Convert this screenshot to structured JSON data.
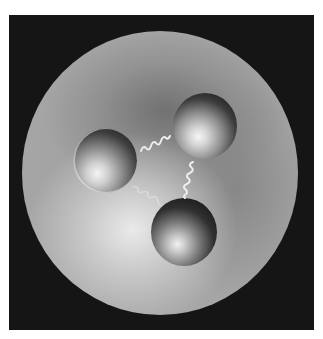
{
  "image": {
    "subject": "Illustration of a baryon (proton) containing three quarks bound by gluons",
    "colors": {
      "page_background": "#ffffff",
      "frame_background": "#151515",
      "hadron_rim": "#a9a9a9",
      "hadron_dark_zone": "#7a7a7a",
      "hadron_bright_zone": "#e0e0e0",
      "gluon_stroke": "#eeeeee"
    },
    "hadron": {
      "shape": "sphere",
      "center": [
        159,
        173
      ],
      "radius": 140
    },
    "quarks": [
      {
        "id": "q1",
        "position": "left",
        "center": [
          105,
          160
        ],
        "radius": 32
      },
      {
        "id": "q2",
        "position": "top-right",
        "center": [
          205,
          126
        ],
        "radius": 33
      },
      {
        "id": "q3",
        "position": "bottom",
        "center": [
          184,
          232
        ],
        "radius": 33
      }
    ],
    "gluons": [
      {
        "connects": [
          "q1",
          "q2"
        ],
        "from": [
          141,
          151
        ],
        "to": [
          170,
          137
        ]
      },
      {
        "connects": [
          "q2",
          "q3"
        ],
        "from": [
          193,
          162
        ],
        "to": [
          193,
          198
        ]
      },
      {
        "connects": [
          "q1",
          "q3"
        ],
        "from": [
          133,
          187
        ],
        "to": [
          158,
          205
        ]
      }
    ]
  }
}
